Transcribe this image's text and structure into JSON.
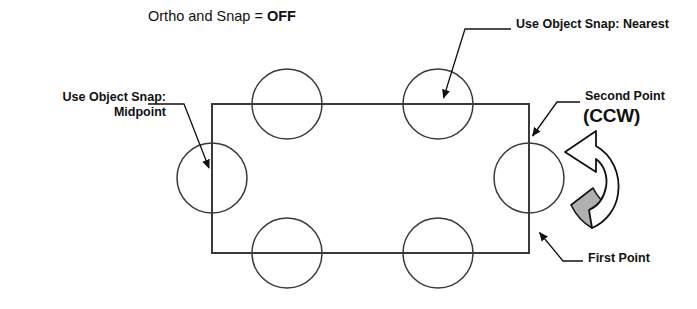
{
  "diagram": {
    "title_prefix": "Ortho and Snap = ",
    "title_value": "OFF",
    "background_color": "#ffffff",
    "line_color": "#3a3a3a",
    "arrow_color": "#111111",
    "gray_fill_color": "#b0b0b0"
  },
  "annotations": {
    "nearest": "Use Object Snap: Nearest",
    "midpoint_line1": "Use Object Snap:",
    "midpoint_line2": "Midpoint",
    "second_point": "Second Point",
    "ccw": "(CCW)",
    "first_point": "First Point"
  },
  "geometry": {
    "rectangle": {
      "x": 212,
      "y": 104,
      "width": 317,
      "height": 149
    },
    "circle_radius": 35,
    "circles": [
      {
        "name": "top-left-circle",
        "cx": 287,
        "cy": 104
      },
      {
        "name": "top-middle-circle",
        "cx": 438,
        "cy": 104
      },
      {
        "name": "left-circle",
        "cx": 212,
        "cy": 178
      },
      {
        "name": "right-circle",
        "cx": 529,
        "cy": 178
      },
      {
        "name": "bottom-left-circle",
        "cx": 287,
        "cy": 253
      },
      {
        "name": "bottom-middle-circle",
        "cx": 438,
        "cy": 253
      }
    ],
    "leaders": [
      {
        "name": "nearest-leader",
        "tip_x": 441,
        "tip_y": 100
      },
      {
        "name": "midpoint-leader",
        "tip_x": 211,
        "tip_y": 171
      },
      {
        "name": "second-point-leader",
        "tip_x": 530,
        "tip_y": 139
      },
      {
        "name": "first-point-leader",
        "tip_x": 537,
        "tip_y": 230
      }
    ],
    "rotation_arrow": {
      "name": "ccw-rotation-arrow",
      "direction": "counterclockwise"
    }
  }
}
